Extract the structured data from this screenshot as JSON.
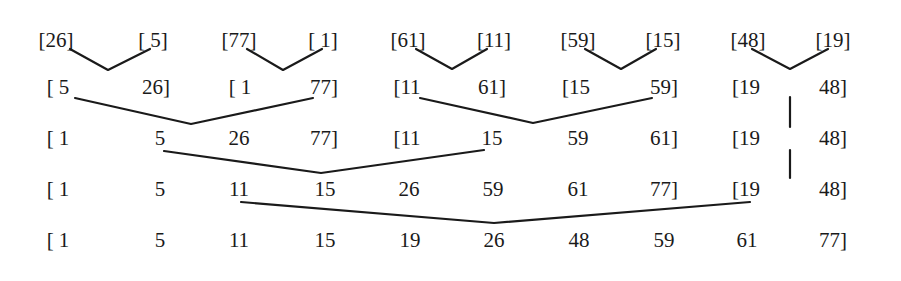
{
  "rows": [
    {
      "pass": 0,
      "y": 40,
      "cells": [
        {
          "text": "[26]",
          "x": 56
        },
        {
          "text": "[ 5]",
          "x": 153
        },
        {
          "text": "[77]",
          "x": 239
        },
        {
          "text": "[ 1]",
          "x": 323
        },
        {
          "text": "[61]",
          "x": 408
        },
        {
          "text": "[11]",
          "x": 494
        },
        {
          "text": "[59]",
          "x": 578
        },
        {
          "text": "[15]",
          "x": 663
        },
        {
          "text": "[48]",
          "x": 748
        },
        {
          "text": "[19]",
          "x": 833
        }
      ]
    },
    {
      "pass": 1,
      "y": 87,
      "cells": [
        {
          "text": "[ 5",
          "x": 58
        },
        {
          "text": "26]",
          "x": 156
        },
        {
          "text": "[ 1",
          "x": 240
        },
        {
          "text": "77]",
          "x": 324
        },
        {
          "text": "[11",
          "x": 407
        },
        {
          "text": "61]",
          "x": 492
        },
        {
          "text": "[15",
          "x": 576
        },
        {
          "text": "59]",
          "x": 664
        },
        {
          "text": "[19",
          "x": 746
        },
        {
          "text": "48]",
          "x": 833
        }
      ]
    },
    {
      "pass": 2,
      "y": 138,
      "cells": [
        {
          "text": "[ 1",
          "x": 58
        },
        {
          "text": "5",
          "x": 160
        },
        {
          "text": "26",
          "x": 239
        },
        {
          "text": "77]",
          "x": 324
        },
        {
          "text": "[11",
          "x": 407
        },
        {
          "text": "15",
          "x": 492
        },
        {
          "text": "59",
          "x": 578
        },
        {
          "text": "61]",
          "x": 664
        },
        {
          "text": "[19",
          "x": 746
        },
        {
          "text": "48]",
          "x": 833
        }
      ]
    },
    {
      "pass": 3,
      "y": 189,
      "cells": [
        {
          "text": "[ 1",
          "x": 58
        },
        {
          "text": "5",
          "x": 160
        },
        {
          "text": "11",
          "x": 239
        },
        {
          "text": "15",
          "x": 325
        },
        {
          "text": "26",
          "x": 409
        },
        {
          "text": "59",
          "x": 493
        },
        {
          "text": "61",
          "x": 578
        },
        {
          "text": "77]",
          "x": 664
        },
        {
          "text": "[19",
          "x": 746
        },
        {
          "text": "48]",
          "x": 833
        }
      ]
    },
    {
      "pass": 4,
      "y": 240,
      "cells": [
        {
          "text": "[ 1",
          "x": 58
        },
        {
          "text": "5",
          "x": 160
        },
        {
          "text": "11",
          "x": 239
        },
        {
          "text": "15",
          "x": 325
        },
        {
          "text": "19",
          "x": 410
        },
        {
          "text": "26",
          "x": 494
        },
        {
          "text": "48",
          "x": 579
        },
        {
          "text": "59",
          "x": 664
        },
        {
          "text": "61",
          "x": 747
        },
        {
          "text": "77]",
          "x": 833
        }
      ]
    }
  ],
  "merges": [
    {
      "from_pass": 0,
      "to_pass": 1,
      "points": "70,49 108,70 150,49"
    },
    {
      "from_pass": 0,
      "to_pass": 1,
      "points": "247,49 283,70 322,49"
    },
    {
      "from_pass": 0,
      "to_pass": 1,
      "points": "416,49 452,69 487,49"
    },
    {
      "from_pass": 0,
      "to_pass": 1,
      "points": "585,49 621,69 656,49"
    },
    {
      "from_pass": 0,
      "to_pass": 1,
      "points": "752,49 790,69 828,49"
    },
    {
      "from_pass": 1,
      "to_pass": 2,
      "points": "75,98 191,124 313,98"
    },
    {
      "from_pass": 1,
      "to_pass": 2,
      "points": "420,98 533,123 652,98"
    },
    {
      "from_pass": 2,
      "to_pass": 3,
      "points": "164,151 321,173 484,150"
    },
    {
      "from_pass": 3,
      "to_pass": 4,
      "points": "241,202 494,223 750,202"
    }
  ],
  "carries": [
    {
      "from_pass": 1,
      "to_pass": 2,
      "x": 790,
      "y1": 97,
      "y2": 127
    },
    {
      "from_pass": 2,
      "to_pass": 3,
      "x": 790,
      "y1": 150,
      "y2": 178
    }
  ]
}
